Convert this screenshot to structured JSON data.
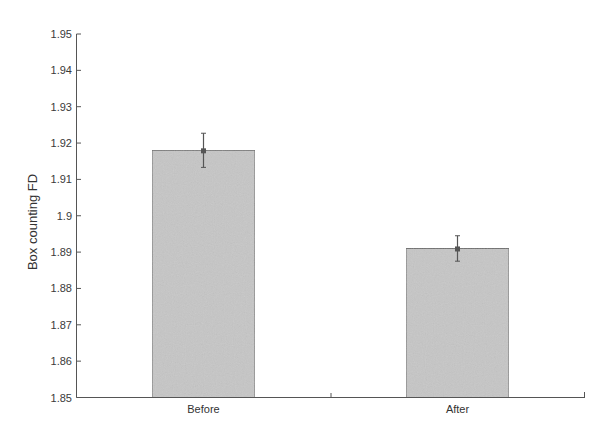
{
  "chart_data": {
    "type": "bar",
    "title": "",
    "xlabel": "",
    "ylabel": "Box counting FD",
    "categories": [
      "Before",
      "After"
    ],
    "values": [
      1.918,
      1.891
    ],
    "errors": [
      0.0047,
      0.0035
    ],
    "ylim": [
      1.85,
      1.95
    ],
    "yticks": [
      1.85,
      1.86,
      1.87,
      1.88,
      1.89,
      1.9,
      1.91,
      1.92,
      1.93,
      1.94,
      1.95
    ],
    "ytick_labels": [
      "1.85",
      "1.86",
      "1.87",
      "1.88",
      "1.89",
      "1.9",
      "1.91",
      "1.92",
      "1.93",
      "1.94",
      "1.95"
    ],
    "grid": false,
    "legend": null,
    "colors": {
      "bar_fill": "#c6c6c6",
      "bar_edge": "#6a6a6a",
      "axis": "#555555",
      "errorbar": "#555555"
    }
  }
}
